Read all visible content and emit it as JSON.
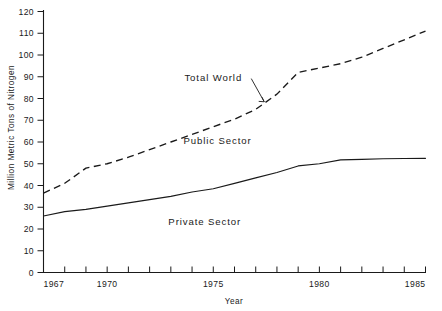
{
  "chart_data": {
    "type": "line",
    "title": "",
    "xlabel": "Year",
    "ylabel": "Million Metric Tons of Nitrogen",
    "xlim": [
      1967,
      1985
    ],
    "ylim": [
      0,
      120
    ],
    "grid": false,
    "legend_position": "inline-annotations",
    "x": [
      1967,
      1968,
      1969,
      1970,
      1971,
      1972,
      1973,
      1974,
      1975,
      1976,
      1977,
      1978,
      1979,
      1980,
      1981,
      1982,
      1983,
      1984,
      1985
    ],
    "series": [
      {
        "name": "Total World",
        "style": "dashed",
        "values": [
          36.5,
          41.0,
          48.0,
          50.0,
          53.0,
          56.5,
          60.0,
          63.5,
          67.0,
          70.5,
          75.0,
          82.0,
          92.0,
          94.0,
          96.0,
          99.0,
          103.0,
          107.0,
          111.0
        ]
      },
      {
        "name": "Private Sector",
        "style": "solid",
        "values": [
          26.0,
          28.0,
          29.0,
          30.5,
          32.0,
          33.5,
          35.0,
          37.0,
          38.5,
          41.0,
          43.5,
          46.0,
          49.0,
          50.0,
          51.8,
          52.0,
          52.3,
          52.4,
          52.5
        ]
      }
    ],
    "annotations": [
      {
        "text": "Total World",
        "x": 1975.0,
        "y": 88.0,
        "leader_to_x": 1977.4,
        "leader_to_y": 78.5
      },
      {
        "text": "Public Sector",
        "x": 1975.2,
        "y": 59.0
      },
      {
        "text": "Private Sector",
        "x": 1974.6,
        "y": 22.0
      }
    ],
    "yticks": [
      0,
      10,
      20,
      30,
      40,
      50,
      60,
      70,
      80,
      90,
      100,
      110,
      120
    ],
    "ytick_labels": [
      "0",
      "10",
      "20",
      "30",
      "40",
      "50",
      "60",
      "70",
      "80",
      "90",
      "100",
      "110",
      "120"
    ],
    "xticks": [
      1967,
      1968,
      1969,
      1970,
      1971,
      1972,
      1973,
      1974,
      1975,
      1976,
      1977,
      1978,
      1979,
      1980,
      1981,
      1982,
      1983,
      1984,
      1985
    ],
    "xtick_labels_shown": [
      {
        "value": 1967,
        "label": "1967"
      },
      {
        "value": 1970,
        "label": "1970"
      },
      {
        "value": 1975,
        "label": "1975"
      },
      {
        "value": 1980,
        "label": "1980"
      },
      {
        "value": 1985,
        "label": "1985"
      }
    ],
    "colors": {
      "line": "#1a1a1a",
      "axis": "#1a1a1a",
      "background": "#ffffff"
    }
  }
}
